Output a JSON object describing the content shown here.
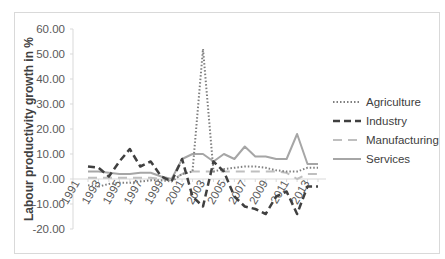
{
  "chart_data": {
    "type": "line",
    "title": "",
    "xlabel": "",
    "ylabel": "Labour productivity growth in %",
    "ylim": [
      -20,
      60
    ],
    "yticks": [
      "60.00",
      "50.00",
      "40.00",
      "30.00",
      "20.00",
      "10.00",
      "0.00",
      "-10.00",
      "-20.00"
    ],
    "xticks": [
      "1991",
      "1993",
      "1995",
      "1997",
      "1999",
      "2001",
      "2003",
      "2005",
      "2007",
      "2009",
      "2011",
      "2013"
    ],
    "x": [
      1991,
      1992,
      1993,
      1994,
      1995,
      1996,
      1997,
      1998,
      1999,
      2000,
      2001,
      2002,
      2003,
      2004,
      2005,
      2006,
      2007,
      2008,
      2009,
      2010,
      2011,
      2012,
      2013
    ],
    "grid": false,
    "legend_position": "right",
    "series": [
      {
        "name": "Agriculture",
        "style": "dotted",
        "color": "#7f7f7f",
        "values": [
          -2.5,
          -3,
          -2,
          -1.5,
          -1.5,
          -1,
          -0.5,
          -0.5,
          -1,
          2,
          3,
          52,
          3,
          4,
          4.5,
          5,
          5,
          4.5,
          3.5,
          3,
          3,
          4.5,
          4.5
        ]
      },
      {
        "name": "Industry",
        "style": "dashed",
        "color": "#404040",
        "values": [
          5,
          4.5,
          1,
          7,
          12,
          5,
          7,
          1,
          -1,
          8,
          -7,
          -11,
          7,
          3,
          -7,
          -11,
          -12,
          -14,
          -7,
          -5,
          -14,
          -3,
          -3
        ]
      },
      {
        "name": "Manufacturing",
        "style": "long-dash",
        "color": "#bfbfbf",
        "values": [
          0.5,
          0.5,
          0.5,
          0.5,
          0.5,
          0.5,
          0.5,
          0,
          -0.5,
          2,
          3,
          3,
          3,
          3,
          3,
          3,
          3,
          3,
          3,
          2.5,
          0,
          2,
          2
        ]
      },
      {
        "name": "Services",
        "style": "solid",
        "color": "#a6a6a6",
        "values": [
          3,
          3,
          2.5,
          2,
          2,
          2.5,
          2.5,
          1,
          0,
          8,
          10,
          10,
          7,
          10,
          8,
          13,
          9,
          9,
          8,
          8,
          18,
          6,
          6
        ]
      }
    ]
  },
  "legend": {
    "items": [
      "Agriculture",
      "Industry",
      "Manufacturing",
      "Services"
    ]
  }
}
